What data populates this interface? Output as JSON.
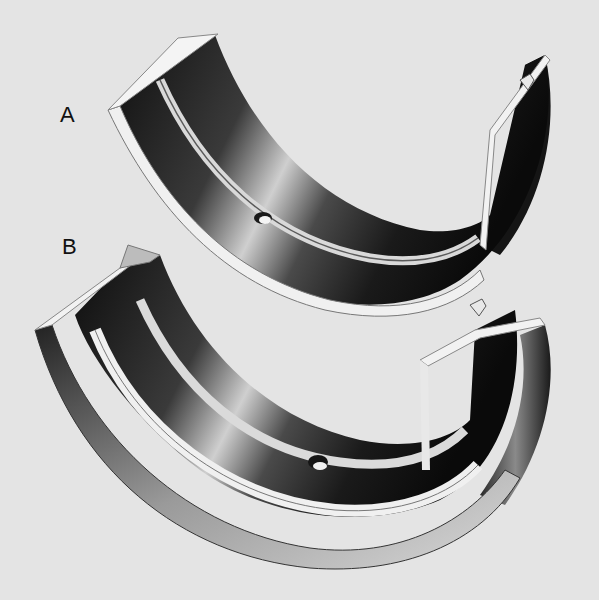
{
  "figure": {
    "labels": [
      {
        "id": "A",
        "text": "A",
        "subject": "plain bearing half-shell with oil groove and oil hole"
      },
      {
        "id": "B",
        "text": "B",
        "subject": "flanged thrust bearing half-shell with oil groove and oil hole"
      }
    ],
    "colors": {
      "background": "#e4e4e4",
      "metal_dark": "#111111",
      "metal_mid": "#7a7a7a",
      "metal_light": "#f2f2f2",
      "label": "#111111"
    }
  }
}
